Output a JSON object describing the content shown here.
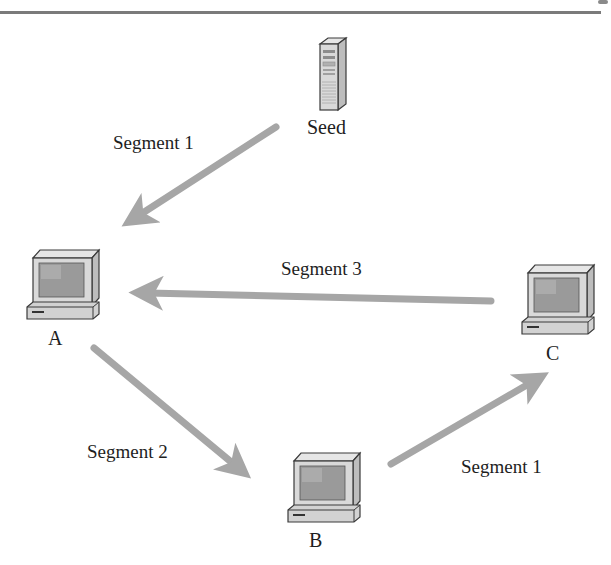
{
  "diagram": {
    "type": "peer-to-peer segment distribution",
    "colors": {
      "arrow": "#a6a6a6",
      "text": "#1e1e1e",
      "rule": "#7a7a7a",
      "device_body": "#d9d9d9",
      "device_outline": "#3a3a3a",
      "screen": "#9a9a9a"
    },
    "nodes": [
      {
        "id": "seed",
        "label": "Seed",
        "icon": "server-tower-icon"
      },
      {
        "id": "a",
        "label": "A",
        "icon": "desktop-computer-icon"
      },
      {
        "id": "b",
        "label": "B",
        "icon": "desktop-computer-icon"
      },
      {
        "id": "c",
        "label": "C",
        "icon": "desktop-computer-icon"
      }
    ],
    "edges": [
      {
        "from": "Seed",
        "to": "A",
        "label": "Segment 1"
      },
      {
        "from": "C",
        "to": "A",
        "label": "Segment 3"
      },
      {
        "from": "A",
        "to": "B",
        "label": "Segment 2"
      },
      {
        "from": "B",
        "to": "C",
        "label": "Segment 1"
      }
    ]
  }
}
